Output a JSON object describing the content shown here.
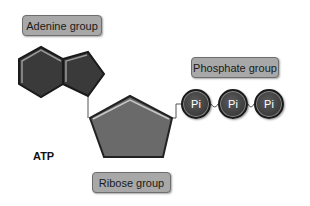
{
  "diagram": {
    "title": "ATP",
    "labels": {
      "adenine": "Adenine group",
      "phosphate": "Phosphate group",
      "ribose": "Ribose group"
    },
    "phosphates": [
      {
        "label": "Pi"
      },
      {
        "label": "Pi"
      },
      {
        "label": "Pi"
      }
    ],
    "colors": {
      "shape_dark": "#3a3a3a",
      "ribose_fill": "#6a6a6a",
      "label_fill": "#a8a8a8"
    }
  }
}
